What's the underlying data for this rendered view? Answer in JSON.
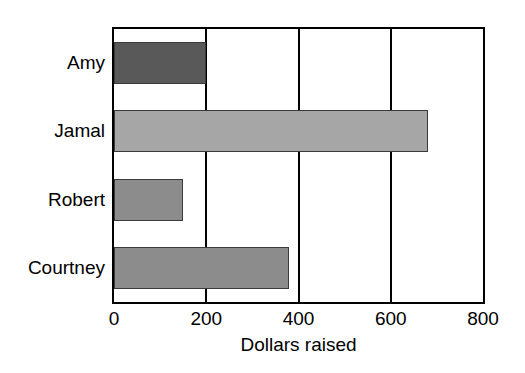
{
  "chart_data": {
    "type": "bar",
    "orientation": "horizontal",
    "title": "",
    "xlabel": "Dollars raised",
    "ylabel": "",
    "categories": [
      "Amy",
      "Jamal",
      "Robert",
      "Courtney"
    ],
    "values": [
      200,
      680,
      150,
      380
    ],
    "series": [
      {
        "name": "Dollars raised",
        "values": [
          200,
          680,
          150,
          380
        ]
      }
    ],
    "xlim": [
      0,
      800
    ],
    "xticks": [
      0,
      200,
      400,
      600,
      800
    ],
    "xtick_labels": [
      "0",
      "200",
      "400",
      "600",
      "800"
    ],
    "grid": true,
    "grid_axis": "x",
    "legend": false,
    "bar_colors": [
      "#595959",
      "#a6a6a6",
      "#8c8c8c",
      "#8c8c8c"
    ],
    "bar_edge_color": "#3a3a3a",
    "frame_color": "#000000",
    "background_color": "#ffffff"
  },
  "axis": {
    "x_title": "Dollars raised",
    "ticks": [
      {
        "label": "0",
        "value": 0
      },
      {
        "label": "200",
        "value": 200
      },
      {
        "label": "400",
        "value": 400
      },
      {
        "label": "600",
        "value": 600
      },
      {
        "label": "800",
        "value": 800
      }
    ]
  },
  "rows": [
    {
      "label": "Amy",
      "value": 200,
      "color": "#595959"
    },
    {
      "label": "Jamal",
      "value": 680,
      "color": "#a6a6a6"
    },
    {
      "label": "Robert",
      "value": 150,
      "color": "#8c8c8c"
    },
    {
      "label": "Courtney",
      "value": 380,
      "color": "#8c8c8c"
    }
  ]
}
